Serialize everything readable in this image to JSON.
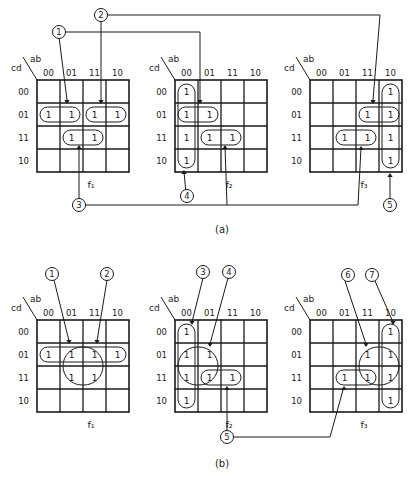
{
  "figure": {
    "caption_a": "(a)",
    "caption_b": "(b)",
    "axis_row_var": "cd",
    "axis_col_var": "ab",
    "col_labels": [
      "00",
      "01",
      "11",
      "10"
    ],
    "row_labels": [
      "00",
      "01",
      "11",
      "10"
    ],
    "cell_value": "1"
  },
  "part_a": {
    "maps": [
      {
        "name": "f1",
        "label": "f₁",
        "ones": [
          [
            1,
            0
          ],
          [
            1,
            1
          ],
          [
            1,
            2
          ],
          [
            1,
            3
          ],
          [
            2,
            1
          ],
          [
            2,
            2
          ]
        ],
        "groups": [
          {
            "r0": 1,
            "c0": 0,
            "r1": 1,
            "c1": 1
          },
          {
            "r0": 1,
            "c0": 2,
            "r1": 1,
            "c1": 3
          },
          {
            "r0": 2,
            "c0": 1,
            "r1": 2,
            "c1": 2
          }
        ]
      },
      {
        "name": "f2",
        "label": "f₂",
        "ones": [
          [
            0,
            0
          ],
          [
            1,
            0
          ],
          [
            2,
            0
          ],
          [
            3,
            0
          ],
          [
            1,
            1
          ],
          [
            2,
            1
          ],
          [
            2,
            2
          ]
        ],
        "groups": [
          {
            "r0": 0,
            "c0": 0,
            "r1": 3,
            "c1": 0
          },
          {
            "r0": 1,
            "c0": 0,
            "r1": 1,
            "c1": 1
          },
          {
            "r0": 2,
            "c0": 1,
            "r1": 2,
            "c1": 2
          }
        ]
      },
      {
        "name": "f3",
        "label": "f₃",
        "ones": [
          [
            0,
            3
          ],
          [
            1,
            2
          ],
          [
            1,
            3
          ],
          [
            2,
            1
          ],
          [
            2,
            2
          ],
          [
            2,
            3
          ],
          [
            3,
            3
          ]
        ],
        "groups": [
          {
            "r0": 0,
            "c0": 3,
            "r1": 3,
            "c1": 3
          },
          {
            "r0": 1,
            "c0": 2,
            "r1": 1,
            "c1": 3
          },
          {
            "r0": 2,
            "c0": 1,
            "r1": 2,
            "c1": 2
          }
        ]
      }
    ],
    "callouts": [
      "1",
      "2",
      "3",
      "4",
      "5"
    ]
  },
  "part_b": {
    "maps": [
      {
        "name": "f1",
        "label": "f₁",
        "ones": [
          [
            1,
            0
          ],
          [
            1,
            1
          ],
          [
            1,
            2
          ],
          [
            1,
            3
          ],
          [
            2,
            1
          ],
          [
            2,
            2
          ]
        ],
        "groups": [
          {
            "r0": 1,
            "c0": 0,
            "r1": 1,
            "c1": 3
          },
          {
            "r0": 1,
            "c0": 1,
            "r1": 2,
            "c1": 2
          }
        ]
      },
      {
        "name": "f2",
        "label": "f₂",
        "ones": [
          [
            0,
            0
          ],
          [
            1,
            0
          ],
          [
            2,
            0
          ],
          [
            3,
            0
          ],
          [
            1,
            1
          ],
          [
            2,
            1
          ],
          [
            2,
            2
          ]
        ],
        "groups": [
          {
            "r0": 0,
            "c0": 0,
            "r1": 3,
            "c1": 0
          },
          {
            "r0": 1,
            "c0": 0,
            "r1": 2,
            "c1": 1
          },
          {
            "r0": 2,
            "c0": 1,
            "r1": 2,
            "c1": 2
          }
        ]
      },
      {
        "name": "f3",
        "label": "f₃",
        "ones": [
          [
            0,
            3
          ],
          [
            1,
            2
          ],
          [
            1,
            3
          ],
          [
            2,
            1
          ],
          [
            2,
            2
          ],
          [
            2,
            3
          ],
          [
            3,
            3
          ]
        ],
        "groups": [
          {
            "r0": 0,
            "c0": 3,
            "r1": 3,
            "c1": 3
          },
          {
            "r0": 1,
            "c0": 2,
            "r1": 2,
            "c1": 3
          },
          {
            "r0": 2,
            "c0": 1,
            "r1": 2,
            "c1": 2
          }
        ]
      }
    ],
    "callouts": [
      "1",
      "2",
      "3",
      "4",
      "5",
      "6",
      "7"
    ]
  }
}
